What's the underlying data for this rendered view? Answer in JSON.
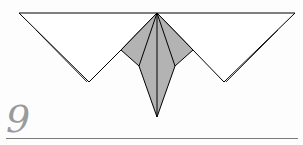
{
  "diagram": {
    "type": "origami-fold-step",
    "step_number": "9",
    "colors": {
      "paper_front": "#ffffff",
      "paper_back": "#b3b3b3",
      "line": "#000000",
      "step_number": "#9a9a9a",
      "rule": "#7a7a7a"
    }
  }
}
